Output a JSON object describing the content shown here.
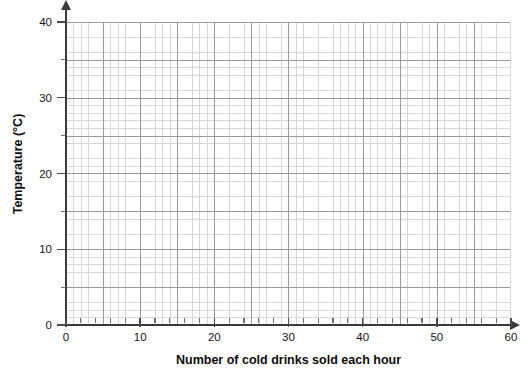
{
  "chart_data": {
    "type": "scatter",
    "title": "",
    "subtitle": "",
    "xlabel": "Number of cold drinks sold each hour",
    "ylabel": "Temperature (°C)",
    "xlim": [
      0,
      60
    ],
    "ylim": [
      0,
      40
    ],
    "x_ticks": [
      0,
      10,
      20,
      30,
      40,
      50,
      60
    ],
    "x_tick_labels": [
      "0",
      "10",
      "20",
      "30",
      "40",
      "50",
      "60"
    ],
    "y_ticks": [
      0,
      10,
      20,
      30,
      40
    ],
    "y_tick_labels": [
      "0",
      "10",
      "20",
      "30",
      "40"
    ],
    "x_minor_step": 2,
    "y_minor_step": 1,
    "x_major_step": 10,
    "y_major_step": 5,
    "grid": true,
    "grid_minor": true,
    "legend": null,
    "series": [],
    "x": [],
    "values": [],
    "annotations": [],
    "colors": {
      "axis": "#3a3a3a",
      "grid_major": "#9b9b9b",
      "grid_minor": "#d7d7d7",
      "text": "#161616",
      "background": "#ffffff"
    }
  },
  "axes": {
    "x": {
      "title": "Number of cold drinks sold each hour",
      "ticks": [
        {
          "value": 0,
          "label": "0"
        },
        {
          "value": 10,
          "label": "10"
        },
        {
          "value": 20,
          "label": "20"
        },
        {
          "value": 30,
          "label": "30"
        },
        {
          "value": 40,
          "label": "40"
        },
        {
          "value": 50,
          "label": "50"
        },
        {
          "value": 60,
          "label": "60"
        }
      ]
    },
    "y": {
      "title": "Temperature (°C)",
      "ticks": [
        {
          "value": 0,
          "label": "0"
        },
        {
          "value": 10,
          "label": "10"
        },
        {
          "value": 20,
          "label": "20"
        },
        {
          "value": 30,
          "label": "30"
        },
        {
          "value": 40,
          "label": "40"
        }
      ]
    }
  }
}
